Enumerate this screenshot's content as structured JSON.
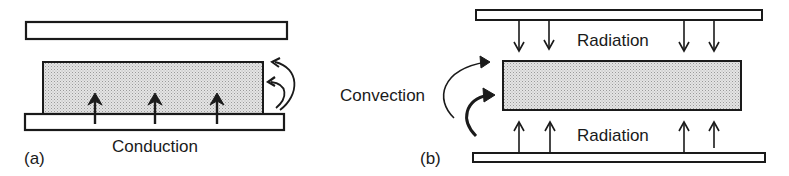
{
  "panel_a": {
    "tag": "(a)",
    "mechanism": "Conduction"
  },
  "panel_b": {
    "tag": "(b)",
    "mechanism_top": "Radiation",
    "mechanism_bottom": "Radiation",
    "mechanism_side": "Convection"
  },
  "colors": {
    "stroke": "#1a1a1a",
    "sample_fill": "#d4d4d4",
    "plate_fill": "#ffffff"
  }
}
